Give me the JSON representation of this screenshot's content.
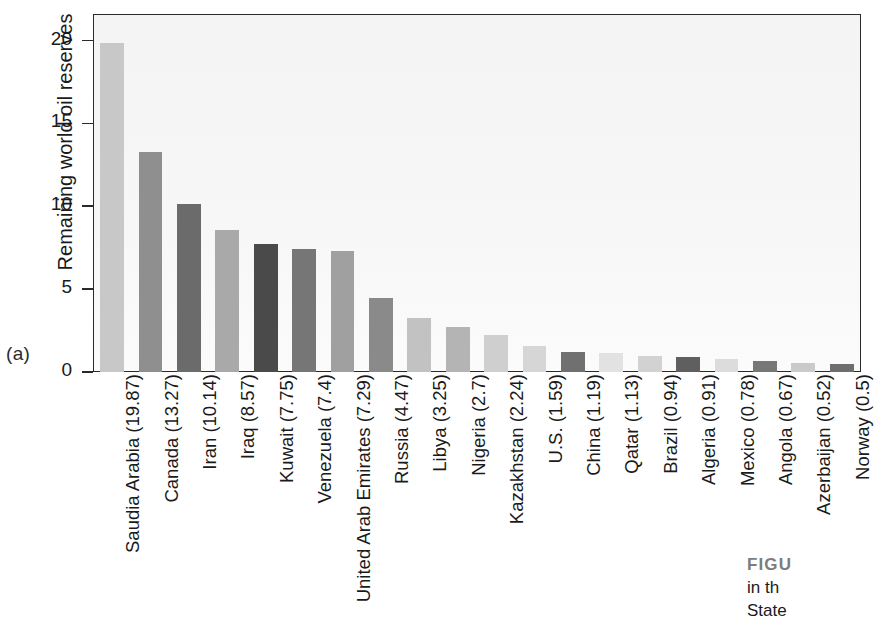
{
  "panel": {
    "letter": "(a)"
  },
  "chart_data": {
    "type": "bar",
    "title": "",
    "xlabel": "",
    "ylabel": "Remaining world oil reserves",
    "ylim": [
      0,
      21.6
    ],
    "yticks": [
      0,
      5,
      10,
      15,
      20
    ],
    "ytick_labels": [
      "0",
      "5",
      "10",
      "15",
      "20"
    ],
    "grid": false,
    "legend": "none",
    "categories": [
      "Saudia Arabia (19.87)",
      "Canada (13.27)",
      "Iran (10.14)",
      "Iraq (8.57)",
      "Kuwait (7.75)",
      "Venezuela (7.4)",
      "United Arab Emirates (7.29)",
      "Russia (4.47)",
      "Libya (3.25)",
      "Nigeria (2.7)",
      "Kazakhstan (2.24)",
      "U.S. (1.59)",
      "China (1.19)",
      "Qatar (1.13)",
      "Brazil (0.94)",
      "Algeria (0.91)",
      "Mexico (0.78)",
      "Angola (0.67)",
      "Azerbaijan (0.52)",
      "Norway (0.5)"
    ],
    "values": [
      19.87,
      13.27,
      10.14,
      8.57,
      7.75,
      7.4,
      7.29,
      4.47,
      3.25,
      2.7,
      2.24,
      1.59,
      1.19,
      1.13,
      0.94,
      0.91,
      0.78,
      0.67,
      0.52,
      0.5
    ],
    "bar_colors": [
      "#c8c8c8",
      "#8f8f8f",
      "#6b6b6b",
      "#a9a9a9",
      "#4a4a4a",
      "#767676",
      "#a0a0a0",
      "#8a8a8a",
      "#c2c2c2",
      "#b4b4b4",
      "#cfcfcf",
      "#d6d6d6",
      "#707070",
      "#e2e2e2",
      "#d2d2d2",
      "#5f5f5f",
      "#dcdcdc",
      "#777777",
      "#cacaca",
      "#6e6e6e"
    ],
    "plot_background": "#f6f6f6",
    "axis_color": "#2a2a2a"
  },
  "caption": {
    "head": "FIGU",
    "line2": "in th",
    "line3": "State"
  }
}
